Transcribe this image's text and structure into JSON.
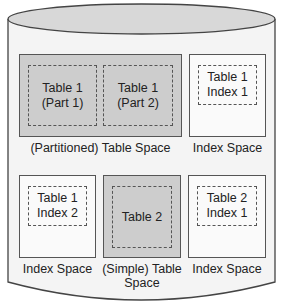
{
  "diagram": {
    "container": "database-cylinder",
    "top_row": {
      "partitioned_table_space": {
        "label": "(Partitioned) Table Space",
        "parts": [
          {
            "line1": "Table 1",
            "line2": "(Part 1)"
          },
          {
            "line1": "Table 1",
            "line2": "(Part 2)"
          }
        ]
      },
      "index_space": {
        "label": "Index Space",
        "line1": "Table 1",
        "line2": "Index 1"
      }
    },
    "bottom_row": {
      "index_space": {
        "label": "Index Space",
        "line1": "Table 1",
        "line2": "Index 2"
      },
      "simple_table_space": {
        "label_line1": "(Simple) Table",
        "label_line2": "Space",
        "line1": "Table 2"
      },
      "index_space_2": {
        "label": "Index Space",
        "line1": "Table 2",
        "line2": "Index 1"
      }
    },
    "colors": {
      "table_space_fill": "#cdcdcd",
      "index_space_fill": "#fafafa",
      "cylinder_body": "#f4f4f4",
      "cylinder_top": "#d8d8d8"
    }
  }
}
